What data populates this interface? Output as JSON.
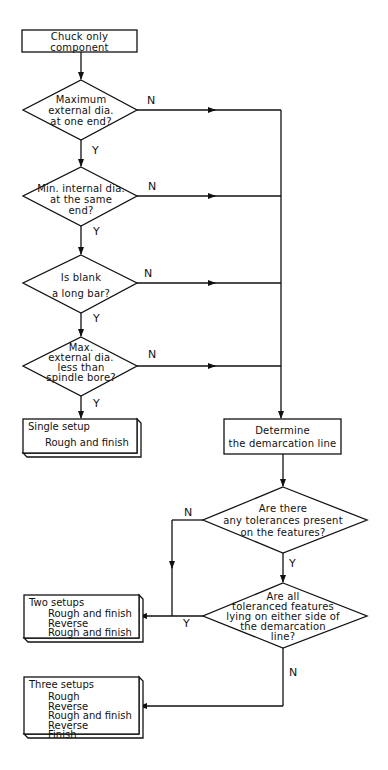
{
  "flowchart": {
    "start": {
      "label_line1": "Chuck only",
      "label_line2": "component"
    },
    "decisions": [
      {
        "id": "d1",
        "lines": [
          "Maximum",
          "external dia.",
          "at one end?"
        ],
        "yes": "Y",
        "no": "N"
      },
      {
        "id": "d2",
        "lines": [
          "Min. internal dia.",
          "at the same",
          "end?"
        ],
        "yes": "Y",
        "no": "N"
      },
      {
        "id": "d3",
        "lines": [
          "Is blank",
          "a long bar?"
        ],
        "yes": "Y",
        "no": "N"
      },
      {
        "id": "d4",
        "lines": [
          "Max.",
          "external dia.",
          "less than",
          "spindle bore?"
        ],
        "yes": "Y",
        "no": "N"
      },
      {
        "id": "d5",
        "lines": [
          "Are there",
          "any tolerances present",
          "on the features?"
        ],
        "yes": "Y",
        "no": "N"
      },
      {
        "id": "d6",
        "lines": [
          "Are all",
          "toleranced features",
          "lying on either side of",
          "the demarcation",
          "line?"
        ],
        "yes": "Y",
        "no": "N"
      }
    ],
    "process": {
      "label_line1": "Determine",
      "label_line2": "the demarcation line"
    },
    "outcomes": {
      "single": {
        "title": "Single setup",
        "steps": [
          "Rough and finish"
        ]
      },
      "two": {
        "title": "Two setups",
        "steps": [
          "Rough and finish",
          "Reverse",
          "Rough and finish"
        ]
      },
      "three": {
        "title": "Three setups",
        "steps": [
          "Rough",
          "Reverse",
          "Rough and finish",
          "Reverse",
          "Finish"
        ]
      }
    }
  }
}
